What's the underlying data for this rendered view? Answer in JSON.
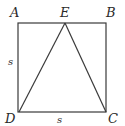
{
  "diagram": {
    "type": "geometry",
    "points": {
      "A": {
        "label": "A",
        "x": 18,
        "y": 23
      },
      "B": {
        "label": "B",
        "x": 106,
        "y": 23
      },
      "C": {
        "label": "C",
        "x": 106,
        "y": 112
      },
      "D": {
        "label": "D",
        "x": 19,
        "y": 112
      },
      "E": {
        "label": "E",
        "x": 65,
        "y": 23
      }
    },
    "side_labels": {
      "left": "s",
      "bottom": "s"
    },
    "colors": {
      "stroke": "#3a3a3a",
      "text": "#2a2a2a",
      "background": "#ffffff"
    }
  }
}
